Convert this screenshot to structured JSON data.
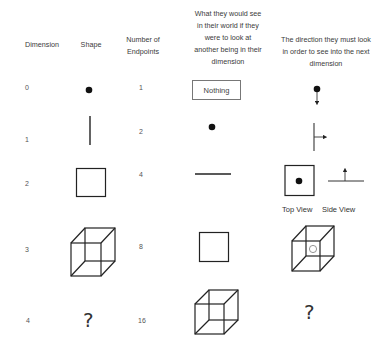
{
  "headers": {
    "dimension": "Dimension",
    "shape": "Shape",
    "endpoints_line1": "Number of",
    "endpoints_line2": "Endpoints",
    "view_lines": [
      "What they would see",
      "in their world if they",
      "were to look at",
      "another being in their",
      "dimension"
    ],
    "direction_lines": [
      "The direction they must look",
      "in order to see into the next",
      "dimension"
    ]
  },
  "rows": [
    {
      "dimension": "0",
      "shape": "point",
      "endpoints": "1",
      "view": "Nothing",
      "direction": "point-with-arrow-down"
    },
    {
      "dimension": "1",
      "shape": "line-segment",
      "endpoints": "2",
      "view": "point",
      "direction": "line-with-arrow-right"
    },
    {
      "dimension": "2",
      "shape": "square",
      "endpoints": "4",
      "view": "line-segment",
      "direction": "top-view-and-side-view"
    },
    {
      "dimension": "3",
      "shape": "cube",
      "endpoints": "8",
      "view": "square",
      "direction": "cube-with-circle"
    },
    {
      "dimension": "4",
      "shape": "?",
      "endpoints": "16",
      "view": "cube",
      "direction": "?"
    }
  ],
  "labels": {
    "top_view": "Top View",
    "side_view": "Side View",
    "unknown_shape": "?",
    "unknown_direction": "?"
  }
}
